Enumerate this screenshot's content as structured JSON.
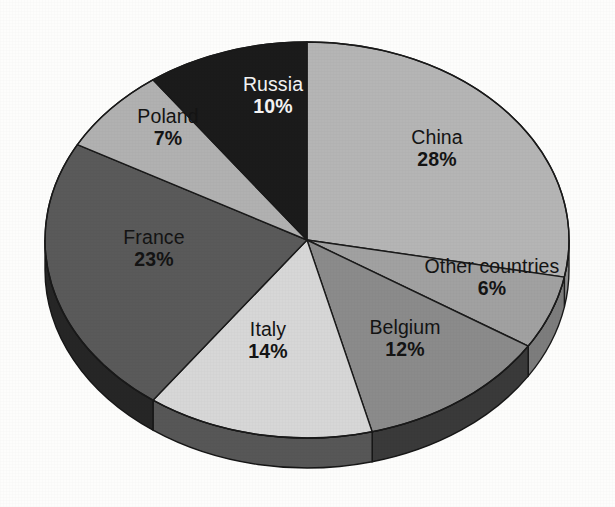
{
  "background_color": "#fdfdfc",
  "chart_data": {
    "type": "pie",
    "title": "",
    "subtitle": "",
    "xlabel": "",
    "ylabel": "",
    "legend_position": "none",
    "grid": false,
    "units": "percent",
    "total": 100,
    "start_angle_deg": 0,
    "direction": "clockwise",
    "three_d": true,
    "categories": [
      "China",
      "Other countries",
      "Belgium",
      "Italy",
      "France",
      "Poland",
      "Russia"
    ],
    "values": [
      28,
      6,
      12,
      14,
      23,
      7,
      10
    ],
    "slices": [
      {
        "name": "China",
        "value": 28,
        "value_label": "28%",
        "color": "#b5b5b5",
        "side_color": "#8f8f8f",
        "text_color": "#141414",
        "label_x": 437,
        "label_y": 148
      },
      {
        "name": "Other countries",
        "value": 6,
        "value_label": "6%",
        "color": "#a1a1a1",
        "side_color": "#7d7d7d",
        "text_color": "#141414",
        "label_x": 492,
        "label_y": 277
      },
      {
        "name": "Belgium",
        "value": 12,
        "value_label": "12%",
        "color": "#8b8b8b",
        "side_color": "#6b6b6b",
        "text_color": "#141414",
        "label_x": 405,
        "label_y": 338
      },
      {
        "name": "Italy",
        "value": 14,
        "value_label": "14%",
        "color": "#d7d7d7",
        "side_color": "#aaaaaa",
        "text_color": "#141414",
        "label_x": 268,
        "label_y": 340
      },
      {
        "name": "France",
        "value": 23,
        "value_label": "23%",
        "color": "#5a5a5a",
        "side_color": "#3f3f3f",
        "text_color": "#141414",
        "label_x": 154,
        "label_y": 248
      },
      {
        "name": "Poland",
        "value": 7,
        "value_label": "7%",
        "color": "#b1b1b1",
        "side_color": "#8a8a8a",
        "text_color": "#141414",
        "label_x": 168,
        "label_y": 127
      },
      {
        "name": "Russia",
        "value": 10,
        "value_label": "10%",
        "color": "#1b1b1b",
        "side_color": "#121212",
        "text_color": "#f4f4f4",
        "label_x": 273,
        "label_y": 95
      }
    ],
    "geometry": {
      "center_x": 307,
      "center_y": 240,
      "radius_x": 262,
      "radius_y": 198,
      "depth": 30,
      "outline_color": "#1a1a1a",
      "outline_width": 1.4
    }
  }
}
